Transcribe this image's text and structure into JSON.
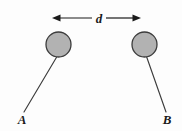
{
  "figure": {
    "type": "physics-diagram",
    "background_color": "#fdfdfd",
    "dimension_label": "d",
    "labels": {
      "left_bob": "A",
      "right_bob": "B"
    },
    "bobs": [
      {
        "name": "A",
        "center_x": 58.5,
        "center_y": 44.5,
        "radius": 12.5,
        "fill_color": "#b2b2b2",
        "stroke_color": "#3c3c3c"
      },
      {
        "name": "B",
        "center_x": 144.5,
        "center_y": 44.5,
        "radius": 12.5,
        "fill_color": "#b2b2b2",
        "stroke_color": "#3c3c3c"
      }
    ],
    "strings": [
      {
        "name": "A",
        "x1": 57.0,
        "y1": 56.5,
        "x2": 24.0,
        "y2": 112.0,
        "color": "#3c3c3c"
      },
      {
        "name": "B",
        "x1": 146.5,
        "y1": 56.5,
        "x2": 166.0,
        "y2": 112.0,
        "color": "#3c3c3c"
      }
    ],
    "dimension_arrow": {
      "left_tip_x": 52,
      "right_tip_x": 141,
      "y": 18,
      "gap_left_x": 92,
      "gap_right_x": 106,
      "color": "#1a1a1a"
    },
    "label_positions": {
      "d": {
        "x": 99,
        "y": 22
      },
      "A": {
        "x": 22,
        "y": 124
      },
      "B": {
        "x": 167,
        "y": 124
      }
    }
  }
}
